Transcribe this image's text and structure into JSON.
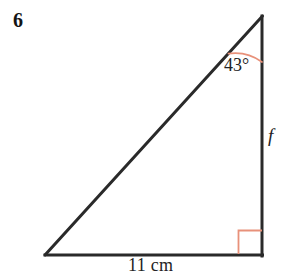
{
  "figure": {
    "question_number": "6",
    "type": "right-triangle",
    "angle_label": "43°",
    "angle_value": 43,
    "angle_unit": "degrees",
    "side_label_vertical": "f",
    "base_label": "11 cm",
    "base_length_value": 11,
    "base_length_unit": "cm",
    "right_angle_marker": "right-angle-square",
    "colors": {
      "stroke": "#2a2a2a",
      "annotation": "#e8917a",
      "background": "#ffffff",
      "text": "#232323"
    },
    "geometry": {
      "vertex_bottom_left": [
        45,
        255
      ],
      "vertex_bottom_right": [
        262,
        255
      ],
      "vertex_apex": [
        262,
        16
      ],
      "stroke_width": 3,
      "annotation_stroke_width": 1.6,
      "arc_radius": 46,
      "right_angle_size": 23
    }
  }
}
